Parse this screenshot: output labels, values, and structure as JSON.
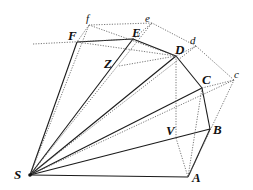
{
  "figure": {
    "colors": {
      "solid_line": "#1a1a1a",
      "dotted_line": "#555555",
      "background": "#ffffff"
    }
  },
  "labels": {
    "S": "S",
    "A": "A",
    "B": "B",
    "C": "C",
    "D": "D",
    "E": "E",
    "F": "F",
    "c": "c",
    "d": "d",
    "e": "e",
    "f": "f",
    "V": "V",
    "Z": "Z"
  },
  "points": {
    "S": [
      30,
      175
    ],
    "A": [
      188,
      177
    ],
    "B": [
      210,
      129
    ],
    "C": [
      202,
      88
    ],
    "D": [
      176,
      56
    ],
    "E": [
      133,
      39
    ],
    "F": [
      77,
      42
    ],
    "c": [
      234,
      80
    ],
    "d": [
      196,
      46
    ],
    "e": [
      152,
      23
    ],
    "f": [
      89,
      25
    ],
    "V": [
      176,
      138
    ],
    "Z": [
      119,
      66
    ]
  }
}
